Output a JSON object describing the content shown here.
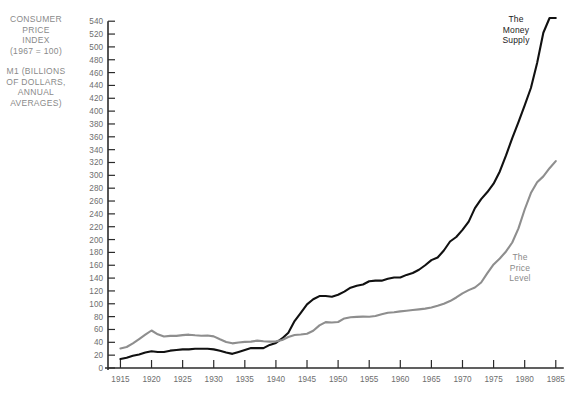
{
  "chart_data": {
    "type": "line",
    "title": "",
    "xlabel": "",
    "ylabel": "",
    "xlim": [
      1913,
      1986
    ],
    "ylim": [
      0,
      545
    ],
    "grid": false,
    "legend_position": "inline-annotation",
    "y_ticks": [
      0,
      20,
      40,
      60,
      80,
      100,
      120,
      140,
      160,
      180,
      200,
      220,
      240,
      260,
      280,
      300,
      320,
      340,
      360,
      380,
      400,
      420,
      440,
      460,
      480,
      500,
      520,
      540
    ],
    "x_ticks": [
      1915,
      1920,
      1925,
      1930,
      1935,
      1940,
      1945,
      1950,
      1955,
      1960,
      1965,
      1970,
      1975,
      1980,
      1985
    ],
    "series": [
      {
        "name": "The Money Supply",
        "color": "#111111",
        "x": [
          1915,
          1916,
          1917,
          1918,
          1919,
          1920,
          1921,
          1922,
          1923,
          1924,
          1925,
          1926,
          1927,
          1928,
          1929,
          1930,
          1931,
          1932,
          1933,
          1934,
          1935,
          1936,
          1937,
          1938,
          1939,
          1940,
          1941,
          1942,
          1943,
          1944,
          1945,
          1946,
          1947,
          1948,
          1949,
          1950,
          1951,
          1952,
          1953,
          1954,
          1955,
          1956,
          1957,
          1958,
          1959,
          1960,
          1961,
          1962,
          1963,
          1964,
          1965,
          1966,
          1967,
          1968,
          1969,
          1970,
          1971,
          1972,
          1973,
          1974,
          1975,
          1976,
          1977,
          1978,
          1979,
          1980,
          1981,
          1982,
          1983,
          1984,
          1985
        ],
        "values": [
          14,
          16,
          19,
          21,
          24,
          26,
          25,
          25,
          27,
          28,
          29,
          29,
          30,
          30,
          30,
          29,
          27,
          24,
          22,
          25,
          28,
          31,
          31,
          31,
          36,
          39,
          46,
          55,
          73,
          86,
          99,
          107,
          112,
          112,
          111,
          114,
          119,
          125,
          128,
          130,
          135,
          136,
          136,
          139,
          141,
          141,
          145,
          148,
          153,
          160,
          168,
          172,
          183,
          197,
          204,
          215,
          228,
          249,
          263,
          274,
          287,
          306,
          331,
          358,
          383,
          409,
          436,
          475,
          522,
          552,
          619
        ]
      },
      {
        "name": "The Price Level",
        "color": "#8e8e8e",
        "x": [
          1915,
          1916,
          1917,
          1918,
          1919,
          1920,
          1921,
          1922,
          1923,
          1924,
          1925,
          1926,
          1927,
          1928,
          1929,
          1930,
          1931,
          1932,
          1933,
          1934,
          1935,
          1936,
          1937,
          1938,
          1939,
          1940,
          1941,
          1942,
          1943,
          1944,
          1945,
          1946,
          1947,
          1948,
          1949,
          1950,
          1951,
          1952,
          1953,
          1954,
          1955,
          1956,
          1957,
          1958,
          1959,
          1960,
          1961,
          1962,
          1963,
          1964,
          1965,
          1966,
          1967,
          1968,
          1969,
          1970,
          1971,
          1972,
          1973,
          1974,
          1975,
          1976,
          1977,
          1978,
          1979,
          1980,
          1981,
          1982,
          1983,
          1984,
          1985
        ],
        "values": [
          30.4,
          32.7,
          38.4,
          45.1,
          51.8,
          58.4,
          52.4,
          49.0,
          50.0,
          50.0,
          51.2,
          51.9,
          50.9,
          50.3,
          50.6,
          49.3,
          44.8,
          40.6,
          38.4,
          39.7,
          40.7,
          41.1,
          42.6,
          41.7,
          41.1,
          41.5,
          43.6,
          48.3,
          51.3,
          52.2,
          53.4,
          58.0,
          66.3,
          71.5,
          70.8,
          71.6,
          77.2,
          79.0,
          79.6,
          80.0,
          79.7,
          80.9,
          83.7,
          86.0,
          86.7,
          88.2,
          89.1,
          90.2,
          91.3,
          92.5,
          94.1,
          96.8,
          100.0,
          104.2,
          109.8,
          116.3,
          121.3,
          125.3,
          133.1,
          147.7,
          161.2,
          170.5,
          181.5,
          195.4,
          217.4,
          246.8,
          272.4,
          289.1,
          298.4,
          311.1,
          322.2
        ]
      }
    ]
  },
  "captions": {
    "cpi_label": "CONSUMER\nPRICE\nINDEX\n(1967 = 100)",
    "m1_label": "M1 (BILLIONS\nOF DOLLARS,\nANNUAL\nAVERAGES)",
    "money_supply_label": "The\nMoney\nSupply",
    "price_level_label": "The\nPrice\nLevel"
  },
  "colors": {
    "money_supply": "#111111",
    "price_level": "#8e8e8e",
    "axis": "#2b2b2b",
    "tick_text": "#6e6e6e",
    "caption_text": "#8a8a8a",
    "background": "#ffffff"
  }
}
